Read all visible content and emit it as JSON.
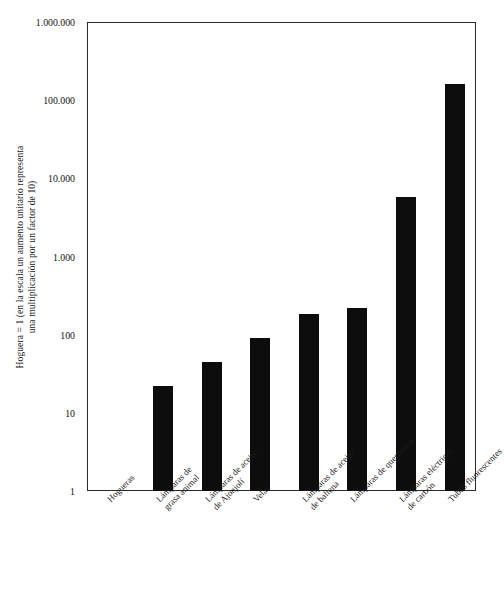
{
  "chart_data": {
    "type": "bar",
    "title": "",
    "subtitle": "",
    "xlabel": "",
    "ylabel": "Hoguera = 1 (en la escala un aumento unitario representa una multiplicación por un factor de 10)",
    "ylabel_lines": [
      "Hoguera = 1 (en la escala un aumento unitario representa",
      "una multiplicación por un factor de 10)"
    ],
    "yscale": "log",
    "ylim": [
      1,
      1000000
    ],
    "grid": false,
    "legend": null,
    "ytick_labels": [
      "1.000.000",
      "100.000",
      "10.000",
      "1.000",
      "100",
      "10",
      "1"
    ],
    "ytick_values": [
      1000000,
      100000,
      10000,
      1000,
      100,
      10,
      1
    ],
    "categories": [
      "Hogueras",
      "Lámparas de grasa animal",
      "Lámparas de aceite de Ajonjolí",
      "Velas",
      "Lámparas de aceite de ballena",
      "Lámparas de queroseno",
      "Lámparas eléctricas de carbón",
      "Tubos fluorescentes"
    ],
    "category_lines": [
      [
        "Hogueras",
        ""
      ],
      [
        "Lámparas de",
        "grasa animal"
      ],
      [
        "Lámparas de aceite",
        "de Ajonjolí"
      ],
      [
        "Velas",
        ""
      ],
      [
        "Lámparas de aceite",
        "de ballena"
      ],
      [
        "Lámparas de queroseno",
        ""
      ],
      [
        "Lámparas eléctricas",
        "de carbón"
      ],
      [
        "Tubos fluorescentes",
        ""
      ]
    ],
    "values": [
      1,
      22,
      45,
      90,
      185,
      220,
      5700,
      160000
    ],
    "bar_color": "#0d0d0d",
    "axis_color": "#2a2a2a",
    "background_color": "#ffffff"
  }
}
